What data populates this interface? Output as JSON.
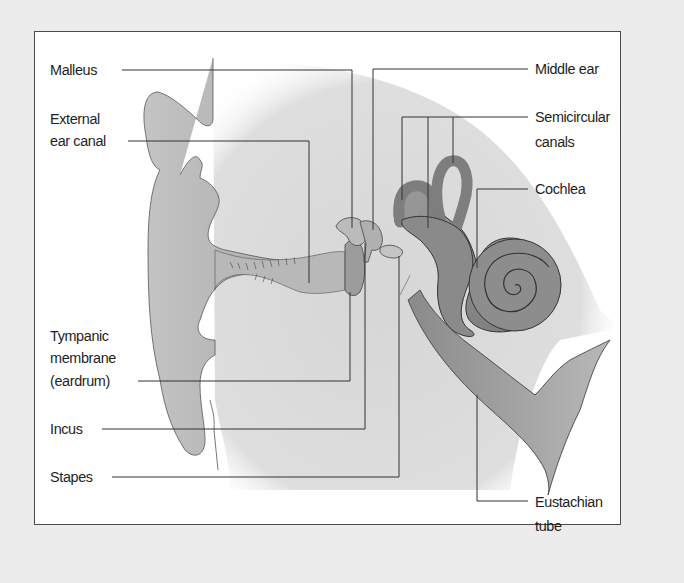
{
  "diagram": {
    "labels_left": [
      {
        "id": "malleus",
        "text": "Malleus"
      },
      {
        "id": "external-ear-canal",
        "lines": [
          "External",
          "ear canal"
        ]
      },
      {
        "id": "tympanic-membrane",
        "lines": [
          "Tympanic",
          "membrane",
          "(eardrum)"
        ]
      },
      {
        "id": "incus",
        "text": "Incus"
      },
      {
        "id": "stapes",
        "text": "Stapes"
      }
    ],
    "labels_right": [
      {
        "id": "middle-ear",
        "text": "Middle ear"
      },
      {
        "id": "semicircular-canals",
        "lines": [
          "Semicircular",
          "canals"
        ]
      },
      {
        "id": "cochlea",
        "text": "Cochlea"
      },
      {
        "id": "eustachian-tube",
        "lines": [
          "Eustachian",
          "tube"
        ]
      }
    ],
    "colors": {
      "background": "#ececec",
      "frame_fill": "#ffffff",
      "frame_border": "#4a4a4a",
      "head_shade": "#dcdcdc",
      "tissue": "#bdbdbd",
      "inner_ear": "#8e8e8e",
      "leader_line": "#333333",
      "text": "#1e1e1e"
    }
  }
}
